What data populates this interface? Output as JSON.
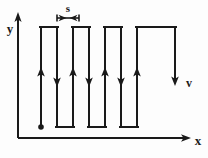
{
  "figure": {
    "type": "line-diagram",
    "background_color": "#fdfdfd",
    "stroke_color": "#1a1a1a",
    "labels": {
      "y_axis": "y",
      "x_axis": "x",
      "velocity": "v",
      "spacing": "s"
    },
    "axes": {
      "origin": {
        "x": 18,
        "y": 138
      },
      "y_axis_top": {
        "x": 18,
        "y": 14
      },
      "x_axis_right": {
        "x": 190,
        "y": 138
      },
      "y_label_pos": {
        "x": 6,
        "y": 30
      },
      "x_label_pos": {
        "x": 196,
        "y": 144
      }
    },
    "path": {
      "description": "Square-wave scan path traversed from a start dot at lower left, alternating upward and downward passes joined by short horizontal steps.",
      "start_point": {
        "x": 41,
        "y": 127
      },
      "top_y": 27,
      "bottom_y": 127,
      "end_point": {
        "x": 175,
        "y": 82
      },
      "vertical_x": [
        41,
        57,
        73,
        89,
        105,
        121,
        137,
        153,
        175
      ],
      "segment_count": 9,
      "direction_sequence": [
        "up",
        "down",
        "up",
        "down",
        "up",
        "down",
        "up",
        "down",
        "down"
      ]
    },
    "arrowheads": [
      {
        "x": 41,
        "y": 73,
        "dir": "up"
      },
      {
        "x": 57,
        "y": 79,
        "dir": "down"
      },
      {
        "x": 73,
        "y": 73,
        "dir": "up"
      },
      {
        "x": 89,
        "y": 79,
        "dir": "down"
      },
      {
        "x": 105,
        "y": 73,
        "dir": "up"
      },
      {
        "x": 121,
        "y": 79,
        "dir": "down"
      },
      {
        "x": 137,
        "y": 73,
        "dir": "up"
      },
      {
        "x": 175,
        "y": 82,
        "dir": "down"
      }
    ],
    "dimension": {
      "label": "s",
      "label_pos": {
        "x": 65,
        "y": 12
      },
      "line_y": 18,
      "from_x": 57,
      "to_x": 79,
      "tick_height": 7
    },
    "velocity_marker": {
      "label": "v",
      "label_pos": {
        "x": 186,
        "y": 80
      },
      "arrow_x": 175,
      "arrow_tip_y": 84
    },
    "start_dot": {
      "x": 41,
      "y": 127,
      "radius": 2.6
    }
  }
}
